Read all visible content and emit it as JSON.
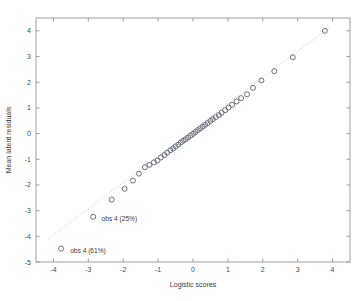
{
  "chart_data": {
    "type": "scatter",
    "title": "",
    "xlabel": "Logistic scores",
    "ylabel": "Mean latent residuals",
    "xlim": [
      -4.5,
      4.5
    ],
    "ylim": [
      -5,
      4.5
    ],
    "xticks": [
      -4,
      -3,
      -2,
      -1,
      0,
      1,
      2,
      3,
      4
    ],
    "xticklabels": [
      "-4",
      "-3",
      "-2",
      "-1",
      "0",
      "1",
      "2",
      "3",
      "4"
    ],
    "yticks": [
      4,
      3,
      2,
      1,
      0,
      -1,
      -2,
      -3,
      -4,
      -5
    ],
    "yticklabels": [
      "4",
      "3",
      "2",
      "1",
      "0",
      "-1",
      "-2",
      "-3",
      "-4",
      "-5"
    ],
    "grid": false,
    "legend": "none",
    "marker": "open-circle",
    "series": [
      {
        "name": "latent residual quantiles",
        "x": [
          -3.78,
          -2.86,
          -2.33,
          -1.96,
          -1.72,
          -1.55,
          -1.38,
          -1.25,
          -1.12,
          -1.02,
          -0.92,
          -0.82,
          -0.74,
          -0.65,
          -0.57,
          -0.5,
          -0.42,
          -0.35,
          -0.28,
          -0.21,
          -0.14,
          -0.07,
          0.0,
          0.07,
          0.14,
          0.21,
          0.28,
          0.35,
          0.42,
          0.5,
          0.57,
          0.65,
          0.74,
          0.82,
          0.92,
          1.02,
          1.12,
          1.25,
          1.38,
          1.55,
          1.72,
          1.96,
          2.33,
          2.86,
          3.78
        ],
        "y": [
          -4.48,
          -3.24,
          -2.57,
          -2.15,
          -1.83,
          -1.56,
          -1.31,
          -1.22,
          -1.12,
          -1.05,
          -0.93,
          -0.83,
          -0.74,
          -0.65,
          -0.58,
          -0.5,
          -0.43,
          -0.35,
          -0.28,
          -0.22,
          -0.15,
          -0.08,
          -0.01,
          0.06,
          0.13,
          0.2,
          0.27,
          0.34,
          0.41,
          0.49,
          0.56,
          0.64,
          0.72,
          0.81,
          0.91,
          1.01,
          1.12,
          1.25,
          1.38,
          1.53,
          1.78,
          2.07,
          2.43,
          2.97,
          4.0
        ]
      }
    ],
    "reference_line": {
      "name": "identity reference",
      "style": "dotted",
      "x": [
        -4.15,
        3.95
      ],
      "y": [
        -4.1,
        4.17
      ]
    },
    "annotations": [
      {
        "text": "obs 4 (25%)",
        "x": -2.86,
        "y": -3.24,
        "label_x": -2.62,
        "label_y": -3.4
      },
      {
        "text": "obs 4 (61%)",
        "x": -3.78,
        "y": -4.48,
        "label_x": -3.52,
        "label_y": -4.66
      }
    ]
  },
  "colors": {
    "background": "#ffffff",
    "frame": "#8a8a8a",
    "marker_stroke": "#555a66",
    "reference_line": "#b0b0b0",
    "text": "#3a3a3a"
  }
}
